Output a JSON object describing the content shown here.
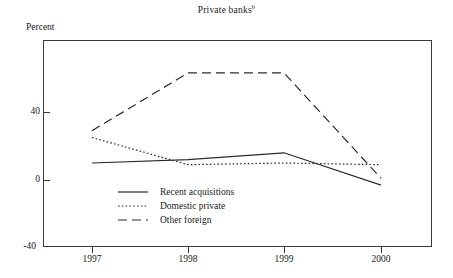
{
  "chart_data": {
    "type": "line",
    "title": "Private banks",
    "title_superscript": "b",
    "ylabel": "Percent",
    "xlabel": "",
    "categories": [
      "1997",
      "1998",
      "1999",
      "2000"
    ],
    "x": [
      1997,
      1998,
      1999,
      2000
    ],
    "ylim": [
      -40,
      80
    ],
    "yticks": [
      40,
      0,
      -40
    ],
    "ytick_labels": [
      "40",
      "0",
      "-40"
    ],
    "grid": false,
    "legend_position": "inside-lower-left",
    "series": [
      {
        "name": "Recent acquisitions",
        "style": "solid",
        "color": "#2b2b2b",
        "values": [
          10,
          12,
          16,
          -3
        ]
      },
      {
        "name": "Domestic private",
        "style": "dotted",
        "color": "#2b2b2b",
        "values": [
          25,
          9,
          10,
          9
        ]
      },
      {
        "name": "Other foreign",
        "style": "dashed",
        "color": "#2b2b2b",
        "values": [
          29,
          63,
          63,
          1
        ]
      }
    ]
  },
  "axis": {
    "ytick_40": "40",
    "ytick_0": "0",
    "ytick_neg40": "-40",
    "xtick_1997": "1997",
    "xtick_1998": "1998",
    "xtick_1999": "1999",
    "xtick_2000": "2000"
  },
  "legend": {
    "items": [
      {
        "label": "Recent acquisitions",
        "style": "solid"
      },
      {
        "label": "Domestic private",
        "style": "dotted"
      },
      {
        "label": "Other foreign",
        "style": "dashed"
      }
    ]
  },
  "colors": {
    "line": "#2b2b2b",
    "frame": "#3a3a3a",
    "background": "#ffffff"
  }
}
